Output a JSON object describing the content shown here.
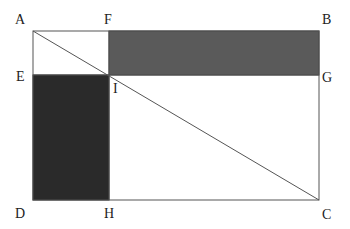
{
  "diagram": {
    "points": {
      "A": {
        "label": "A",
        "x": 33,
        "y": 31
      },
      "F": {
        "label": "F",
        "x": 109,
        "y": 31
      },
      "B": {
        "label": "B",
        "x": 319,
        "y": 31
      },
      "E": {
        "label": "E",
        "x": 33,
        "y": 75
      },
      "I": {
        "label": "I",
        "x": 109,
        "y": 75
      },
      "G": {
        "label": "G",
        "x": 319,
        "y": 75
      },
      "D": {
        "label": "D",
        "x": 33,
        "y": 200
      },
      "H": {
        "label": "H",
        "x": 109,
        "y": 200
      },
      "C": {
        "label": "C",
        "x": 319,
        "y": 200
      }
    },
    "shaded_regions": [
      {
        "name": "rectangle-FBGI",
        "color": "#5a5a5a"
      },
      {
        "name": "rectangle-EIHD",
        "color": "#2a2a2a"
      }
    ],
    "lines": [
      "AB",
      "BC",
      "CD",
      "DA",
      "AC",
      "EG",
      "FH"
    ],
    "colors": {
      "stroke": "#555555",
      "upper_fill": "#5a5a5a",
      "lower_fill": "#2a2a2a"
    }
  }
}
